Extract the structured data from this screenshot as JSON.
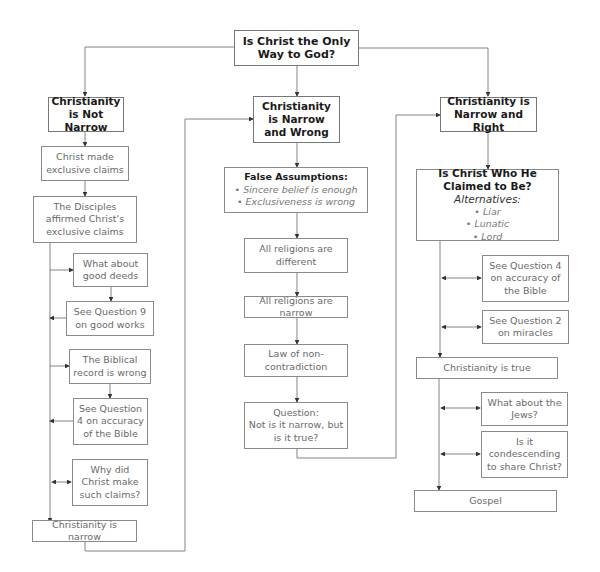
{
  "title": "Is Christ the Only Way to God?",
  "columns": {
    "left": {
      "header": "Christianity is Not Narrow",
      "nodes": [
        "Christ made exclusive claims",
        "The Disciples affirmed Christ's exclusive claims",
        "What about good deeds",
        "See Question 9 on good works",
        "The Biblical record is wrong",
        "See Question 4 on accuracy of the Bible",
        "Why did Christ make such claims?",
        "Christianity is narrow"
      ]
    },
    "middle": {
      "header": "Christianity is Narrow and Wrong",
      "false_assumptions": {
        "title": "False Assumptions:",
        "items": [
          "• Sincere belief is enough",
          "• Exclusiveness is wrong"
        ]
      },
      "nodes": [
        "All religions are different",
        "All religions are narrow",
        "Law of non-contradiction"
      ],
      "question": {
        "label": "Question:",
        "text": "Not is it narrow, but is it true?"
      }
    },
    "right": {
      "header": "Christianity is Narrow and Right",
      "claim": {
        "title": "Is Christ Who He Claimed to Be?",
        "alt_label": "Alternatives:",
        "items": [
          "• Liar",
          "• Lunatic",
          "• Lord"
        ]
      },
      "nodes": [
        "See Question 4 on accuracy of the Bible",
        "See Question 2 on miracles",
        "Christianity is true",
        "What about the Jews?",
        "Is it condescending to share Christ?",
        "Gospel"
      ]
    }
  },
  "colors": {
    "line": "#555555",
    "border": "#8a8a8a",
    "bold_text": "#1a1a1a",
    "light_text": "#6a6a6a"
  }
}
